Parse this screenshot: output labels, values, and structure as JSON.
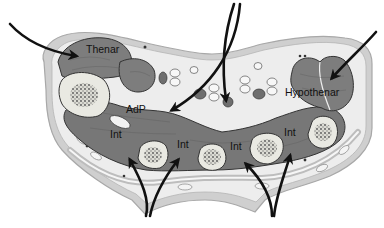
{
  "figure": {
    "colors": {
      "background": "#ffffff",
      "skin": "#c8c8c8",
      "subcutaneous": "#ececec",
      "muscle": "#7a7a7a",
      "muscle_outline": "#3a3a3a",
      "bone_cortex": "#e6e6e0",
      "bone_marrow": "#6a6a6a",
      "arrow": "#111111"
    },
    "labels": {
      "thenar": "Thenar",
      "adductor_pollicis": "AdP",
      "hypothenar": "Hypothenar",
      "interosseous_1": "Int",
      "interosseous_2": "Int",
      "interosseous_3": "Int",
      "interosseous_4": "Int"
    },
    "arrows": [
      {
        "name": "thenar-arrow",
        "target": "Thenar"
      },
      {
        "name": "adp-arrow",
        "target": "AdP"
      },
      {
        "name": "central-arrow",
        "target": "central compartment"
      },
      {
        "name": "hypothenar-arrow",
        "target": "Hypothenar"
      },
      {
        "name": "int-arrow-1",
        "target": "Int"
      },
      {
        "name": "int-arrow-2",
        "target": "Int"
      },
      {
        "name": "int-arrow-3",
        "target": "Int"
      },
      {
        "name": "int-arrow-4",
        "target": "Int"
      }
    ]
  }
}
